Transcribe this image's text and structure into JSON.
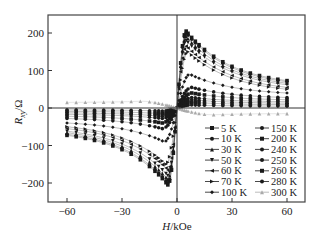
{
  "chart_data": {
    "type": "scatter",
    "title": "",
    "xlabel": "H/kOe",
    "ylabel": "Rxy/Ω",
    "xlim": [
      -70,
      70
    ],
    "ylim": [
      -250,
      250
    ],
    "xticks": [
      -60,
      -30,
      0,
      30,
      60
    ],
    "yticks": [
      -200,
      -100,
      0,
      100,
      200
    ],
    "grid": false,
    "legend_position": "lower right",
    "x": [
      -60,
      -55,
      -50,
      -45,
      -40,
      -35,
      -30,
      -25,
      -20,
      -15,
      -12,
      -10,
      -8,
      -6,
      -5,
      -4,
      -3,
      -2,
      -1,
      0,
      1,
      2,
      3,
      4,
      5,
      6,
      8,
      10,
      12,
      15,
      20,
      25,
      30,
      35,
      40,
      45,
      50,
      55,
      60
    ],
    "series": [
      {
        "name": "5 K",
        "marker": "square",
        "peak": 205,
        "peak_h": 5,
        "end": 73
      },
      {
        "name": "10 K",
        "marker": "circle",
        "peak": 200,
        "peak_h": 5,
        "end": 70
      },
      {
        "name": "30 K",
        "marker": "triangle-up",
        "peak": 190,
        "peak_h": 5,
        "end": 66
      },
      {
        "name": "50 K",
        "marker": "triangle-down",
        "peak": 180,
        "peak_h": 5,
        "end": 62
      },
      {
        "name": "60 K",
        "marker": "triangle-left",
        "peak": 165,
        "peak_h": 5,
        "end": 55
      },
      {
        "name": "70 K",
        "marker": "triangle-right",
        "peak": 150,
        "peak_h": 6,
        "end": 50
      },
      {
        "name": "100 K",
        "marker": "diamond",
        "peak": 90,
        "peak_h": 7,
        "end": 40
      },
      {
        "name": "150 K",
        "marker": "circle",
        "peak": 55,
        "peak_h": 8,
        "end": 28
      },
      {
        "name": "200 K",
        "marker": "square",
        "peak": 40,
        "peak_h": 8,
        "end": 22
      },
      {
        "name": "240 K",
        "marker": "circle",
        "peak": 28,
        "peak_h": 8,
        "end": 17
      },
      {
        "name": "250 K",
        "marker": "circle",
        "peak": 22,
        "peak_h": 8,
        "end": 13
      },
      {
        "name": "260 K",
        "marker": "square",
        "peak": 15,
        "peak_h": 8,
        "end": 9
      },
      {
        "name": "280 K",
        "marker": "circle",
        "peak": 8,
        "peak_h": 8,
        "end": 5
      },
      {
        "name": "300 K",
        "marker": "triangle-up",
        "peak": -18,
        "peak_h": 20,
        "end": -15,
        "color": "#aaaaaa"
      }
    ]
  },
  "axes": {
    "xlabel_main": "H",
    "xlabel_unit": "/kOe",
    "ylabel_main": "R",
    "ylabel_sub": "xy",
    "ylabel_unit": "/Ω"
  },
  "legend": {
    "col1": [
      "5 K",
      "10 K",
      "30 K",
      "50 K",
      "60 K",
      "70 K",
      "100 K"
    ],
    "col2": [
      "150 K",
      "200 K",
      "240 K",
      "250 K",
      "260 K",
      "280 K",
      "300 K"
    ]
  }
}
